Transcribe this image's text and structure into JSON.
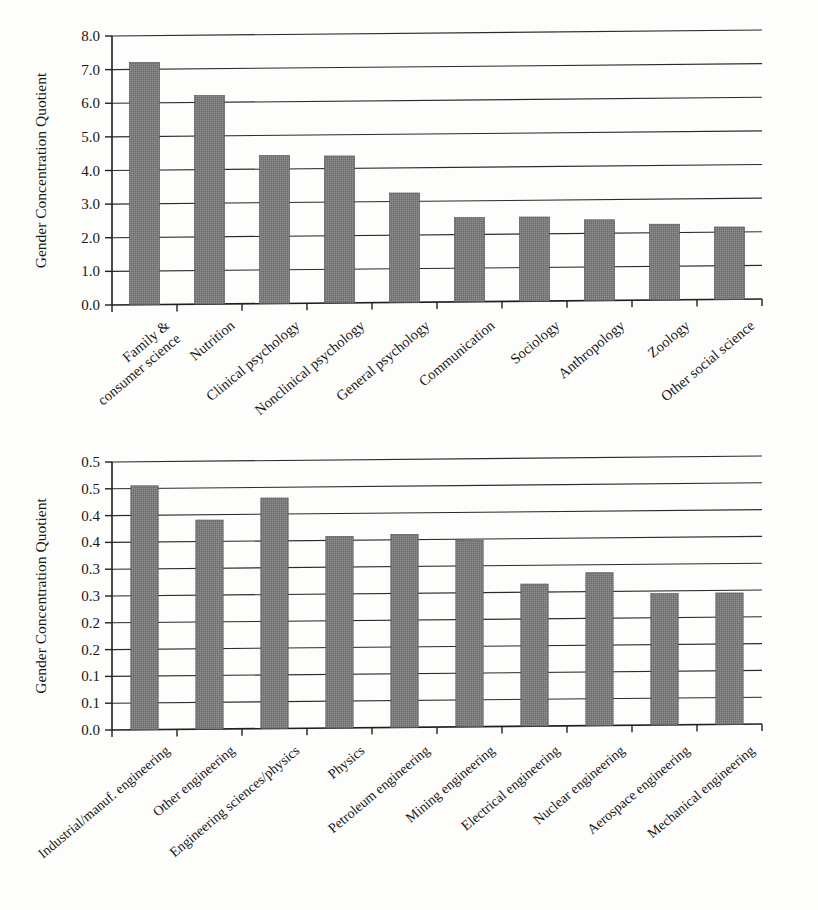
{
  "document": {
    "kind": "two-panel-bar-figure",
    "panel_count": 2
  },
  "colors": {
    "bar_fill": "#7c7c7c",
    "bar_stroke": "#555555",
    "grid": "#2b2b2b",
    "axis": "#1f1f1f",
    "text": "#171717",
    "background": "#fdfdfc"
  },
  "chart_data": [
    {
      "id": "top",
      "type": "bar",
      "title": "",
      "xlabel": "",
      "ylabel": "Gender Concentration Quotient",
      "ylim": [
        0,
        8
      ],
      "ytick_step": 1,
      "ytick_labels": [
        "0.0",
        "1.0",
        "2.0",
        "3.0",
        "4.0",
        "5.0",
        "6.0",
        "7.0",
        "8.0"
      ],
      "ytick_values": [
        0,
        1,
        2,
        3,
        4,
        5,
        6,
        7,
        8
      ],
      "grid": "horizontal",
      "legend": "none",
      "categories": [
        "Family & consumer science",
        "Nutrition",
        "Clinical psychology",
        "Nonclinical psychology",
        "General psychology",
        "Communication",
        "Sociology",
        "Anthropology",
        "Zoology",
        "Other social science"
      ],
      "category_lines": [
        [
          "Family &",
          "consumer science"
        ],
        [
          "Nutrition"
        ],
        [
          "Clinical psychology"
        ],
        [
          "Nonclinical psychology"
        ],
        [
          "General psychology"
        ],
        [
          "Communication"
        ],
        [
          "Sociology"
        ],
        [
          "Anthropology"
        ],
        [
          "Zoology"
        ],
        [
          "Other social science"
        ]
      ],
      "values": [
        7.2,
        6.2,
        4.4,
        4.37,
        3.25,
        2.5,
        2.5,
        2.4,
        2.25,
        2.15
      ]
    },
    {
      "id": "bottom",
      "type": "bar",
      "title": "",
      "xlabel": "",
      "ylabel": "Gender Concentration Quotient",
      "ylim": [
        0,
        0.5
      ],
      "ytick_step": 0.05,
      "ytick_labels": [
        "0.0",
        "0.1",
        "0.1",
        "0.2",
        "0.2",
        "0.3",
        "0.3",
        "0.4",
        "0.4",
        "0.5"
      ],
      "ytick_values": [
        0.0,
        0.05,
        0.1,
        0.15,
        0.2,
        0.25,
        0.3,
        0.35,
        0.4,
        0.45,
        0.5
      ],
      "ytick_labels_full": [
        "0.0",
        "0.1",
        "0.1",
        "0.2",
        "0.2",
        "0.3",
        "0.3",
        "0.4",
        "0.4",
        "0.5",
        "0.5"
      ],
      "grid": "horizontal",
      "legend": "none",
      "categories": [
        "Industrial/manuf. engineering",
        "Other engineering",
        "Engineering sciences/physics",
        "Physics",
        "Petroleum engineering",
        "Mining engineering",
        "Electrical engineering",
        "Nuclear engineering",
        "Aerospace engineering",
        "Mechanical engineering"
      ],
      "category_lines": [
        [
          "Industrial/manuf. engineering"
        ],
        [
          "Other engineering"
        ],
        [
          "Engineering sciences/physics"
        ],
        [
          "Physics"
        ],
        [
          "Petroleum engineering"
        ],
        [
          "Mining engineering"
        ],
        [
          "Electrical engineering"
        ],
        [
          "Nuclear engineering"
        ],
        [
          "Aerospace engineering"
        ],
        [
          "Mechanical engineering"
        ]
      ],
      "values": [
        0.455,
        0.39,
        0.43,
        0.357,
        0.36,
        0.348,
        0.265,
        0.285,
        0.245,
        0.245
      ]
    }
  ]
}
